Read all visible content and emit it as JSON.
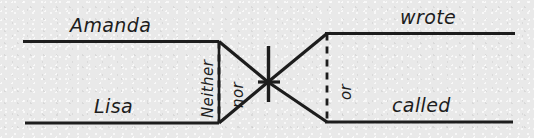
{
  "diagram": {
    "type": "sentence-diagram",
    "style": "handwritten-ink-on-paper",
    "background_color": "#e9e9e9",
    "ink_color": "#1d1d1d",
    "sentence": "Neither Amanda nor Lisa wrote or called",
    "labels": {
      "subject_top": "Amanda",
      "subject_bottom": "Lisa",
      "conjunction_left_first": "Neither",
      "conjunction_left_second": "nor",
      "conjunction_right": "or",
      "verb_top": "wrote",
      "verb_bottom": "called"
    },
    "parts": [
      {
        "name": "subject-top-line",
        "label": "Amanda",
        "orientation": "horizontal"
      },
      {
        "name": "subject-bottom-line",
        "label": "Lisa",
        "orientation": "horizontal"
      },
      {
        "name": "correlative-left-dashed",
        "label": "nor",
        "orientation": "vertical",
        "stroke": "dashed"
      },
      {
        "name": "correlative-left-solid",
        "label": "Neither",
        "orientation": "vertical",
        "stroke": "solid"
      },
      {
        "name": "subject-verb-divider",
        "label": "",
        "orientation": "vertical",
        "stroke": "solid"
      },
      {
        "name": "correlative-right-dashed",
        "label": "or",
        "orientation": "vertical",
        "stroke": "dashed"
      },
      {
        "name": "verb-top-line",
        "label": "wrote",
        "orientation": "horizontal"
      },
      {
        "name": "verb-bottom-line",
        "label": "called",
        "orientation": "horizontal"
      }
    ]
  }
}
